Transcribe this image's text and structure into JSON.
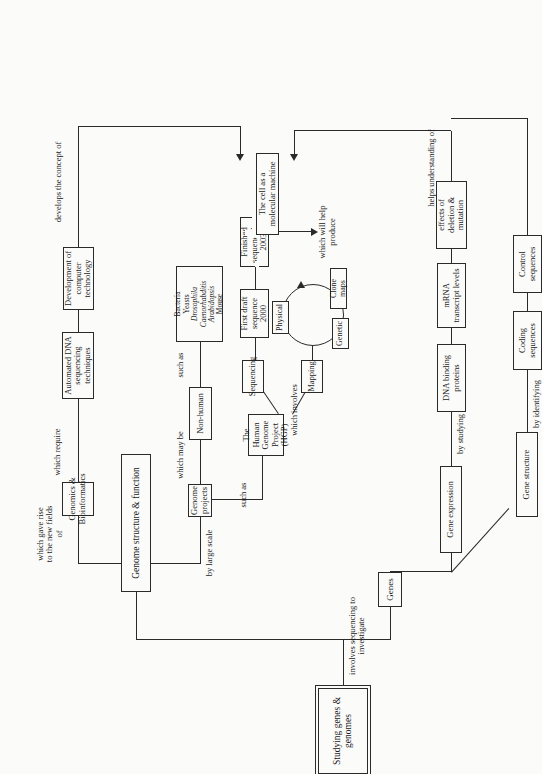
{
  "diagram": {
    "orientation": "rotated-90",
    "nodes": {
      "root": "Studying genes & genomes",
      "genome_structure_function": "Genome structure & function",
      "genomics_bioinformatics": "Genomics & Bioinformatics",
      "automated_dna": "Automated DNA sequencing techniques",
      "computer_tech": "Development of computer technology",
      "genome_projects": "Genome projects",
      "non_human": "Non-human",
      "species_1": "Bacteria",
      "species_2": "Yeasts",
      "species_3": "Drosophila",
      "species_4": "Caenorhabditis",
      "species_5": "Arabidopsis",
      "species_6": "Mouse",
      "hgp": "The Human Genome Project (HGP)",
      "sequencing": "Sequencing",
      "first_draft": "First draft sequence 2000",
      "finished_seq": "Finished sequence by 2003",
      "mapping": "Mapping",
      "physical": "Physical",
      "genetic": "Genetic",
      "clone_maps": "Clone maps",
      "genes": "Genes",
      "gene_expression": "Gene expression",
      "dna_binding": "DNA binding proteins",
      "mrna_levels": "mRNA transcript levels",
      "deletion_mutation": "effects of deletion & mutation",
      "gene_structure": "Gene structure",
      "coding_sequences": "Coding sequences",
      "control_sequences": "Control sequences",
      "cell_machine": "The cell as a molecular machine"
    },
    "links": {
      "involves_sequencing": "involves sequencing to investigate",
      "which_gave_rise": "which gave rise\nto the new fields of",
      "which_require": "which require",
      "by_large_scale": "by large scale",
      "which_may_be": "which may be",
      "such_as_species": "such as",
      "such_as_hgp": "such as",
      "which_involves": "which involves",
      "which_will_help_produce": "which will help produce",
      "by_studying": "by studying",
      "by_identifying": "by identifying",
      "helps_understanding_of": "helps understanding of",
      "develops_the_concept_of": "develops the concept of"
    },
    "colors": {
      "stroke": "#2a2a2a",
      "background": "#fbfbf9",
      "text": "#1a1a1a"
    }
  }
}
